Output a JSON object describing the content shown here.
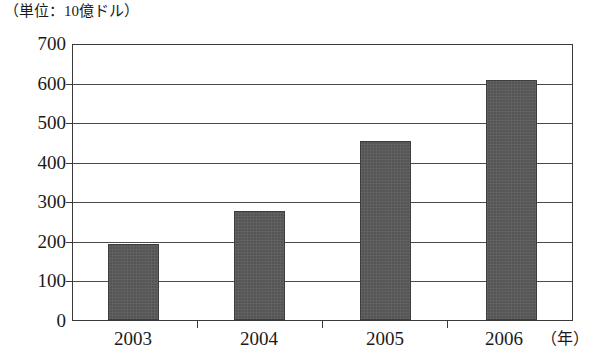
{
  "chart_data": {
    "type": "bar",
    "title": "（単位：10億ドル）",
    "xlabel": "（年）",
    "ylabel": "",
    "categories": [
      "2003",
      "2004",
      "2005",
      "2006"
    ],
    "values": [
      193,
      278,
      455,
      612
    ],
    "ylim": [
      0,
      700
    ],
    "yticks": [
      0,
      100,
      200,
      300,
      400,
      500,
      600,
      700
    ],
    "ytick_labels": [
      "0",
      "100",
      "200",
      "300",
      "400",
      "500",
      "600",
      "700"
    ],
    "grid": true,
    "legend": null,
    "series": [
      {
        "name": "",
        "values": [
          193,
          278,
          455,
          612
        ],
        "color": "#555555"
      }
    ]
  },
  "caption": {
    "unit_note": "（単位：10億ドル）",
    "year_note": "（年）"
  },
  "colors": {
    "bar_fill": "#555555",
    "bar_border": "#3d3d3d",
    "axis": "#3a3a3a",
    "gridline": "#4a4a4a",
    "background": "#ffffff",
    "text": "#1a1a1a"
  }
}
